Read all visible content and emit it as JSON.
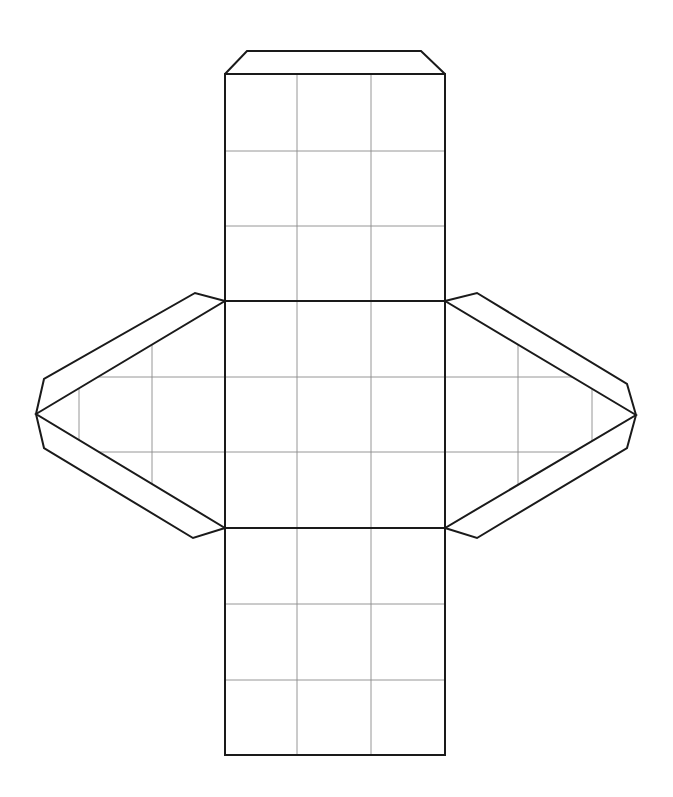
{
  "diagram": {
    "title": "",
    "colors": {
      "outline": "#1a1a1a",
      "grid": "#8a8a8a",
      "background": "#ffffff"
    },
    "components": [
      {
        "id": "top-tab",
        "type": "glue-tab",
        "attached_to": "column-top-edge"
      },
      {
        "id": "column",
        "type": "rectangle-strip",
        "rows": 9,
        "columns": 3,
        "grid": true
      },
      {
        "id": "left-triangle",
        "type": "triangle-face",
        "attached_to": "column-middle-section-left",
        "grid": true
      },
      {
        "id": "right-triangle",
        "type": "triangle-face",
        "attached_to": "column-middle-section-right",
        "grid": true
      },
      {
        "id": "left-upper-tab",
        "type": "glue-tab",
        "attached_to": "left-triangle-upper-edge"
      },
      {
        "id": "left-lower-tab",
        "type": "glue-tab",
        "attached_to": "left-triangle-lower-edge"
      },
      {
        "id": "right-upper-tab",
        "type": "glue-tab",
        "attached_to": "right-triangle-upper-edge"
      },
      {
        "id": "right-lower-tab",
        "type": "glue-tab",
        "attached_to": "right-triangle-lower-edge"
      }
    ],
    "column_sections": 3,
    "rows_per_section": 3
  }
}
